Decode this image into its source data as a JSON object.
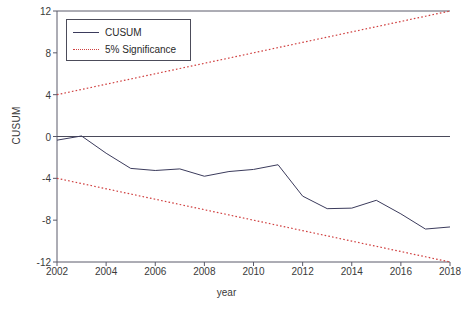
{
  "chart_data": {
    "type": "line",
    "title": "",
    "xlabel": "year",
    "ylabel": "CUSUM",
    "xlim": [
      2002,
      2018
    ],
    "ylim": [
      -12,
      12
    ],
    "grid": false,
    "legend_position": "top-left",
    "xticks": [
      "2002",
      "2004",
      "2006",
      "2008",
      "2010",
      "2012",
      "2014",
      "2016",
      "2018"
    ],
    "xtick_values": [
      2002,
      2004,
      2006,
      2008,
      2010,
      2012,
      2014,
      2016,
      2018
    ],
    "yticks": [
      "12",
      "8",
      "4",
      "0",
      "-4",
      "-8",
      "-12"
    ],
    "ytick_values": [
      12,
      8,
      4,
      0,
      -4,
      -8,
      -12
    ],
    "x": [
      2002,
      2003,
      2004,
      2005,
      2006,
      2007,
      2008,
      2009,
      2010,
      2011,
      2012,
      2013,
      2014,
      2015,
      2016,
      2017,
      2018
    ],
    "series": [
      {
        "name": "CUSUM",
        "color": "#3b3b5c",
        "style": "solid",
        "values": [
          -0.35,
          0.05,
          -1.6,
          -3.05,
          -3.25,
          -3.1,
          -3.8,
          -3.35,
          -3.15,
          -2.7,
          -5.7,
          -6.9,
          -6.85,
          -6.1,
          -7.4,
          -8.85,
          -8.65
        ]
      },
      {
        "name": "5% Significance",
        "color": "#d04040",
        "style": "dotted",
        "values": [
          4.0,
          4.5,
          5.0,
          5.5,
          6.0,
          6.5,
          7.0,
          7.5,
          8.0,
          8.5,
          9.0,
          9.5,
          10.0,
          10.5,
          11.0,
          11.5,
          12.0
        ]
      },
      {
        "name": "5% Significance",
        "color": "#d04040",
        "style": "dotted",
        "values": [
          -4.0,
          -4.5,
          -5.0,
          -5.5,
          -6.0,
          -6.5,
          -7.0,
          -7.5,
          -8.0,
          -8.5,
          -9.0,
          -9.5,
          -10.0,
          -10.5,
          -11.0,
          -11.5,
          -12.0
        ]
      }
    ],
    "zero_line": 0
  },
  "legend": {
    "items": [
      {
        "label": "CUSUM",
        "style": "solid",
        "color": "#3b3b5c"
      },
      {
        "label": "5% Significance",
        "style": "dotted",
        "color": "#d04040"
      }
    ]
  },
  "axes": {
    "y_title": "CUSUM",
    "x_title": "year"
  }
}
